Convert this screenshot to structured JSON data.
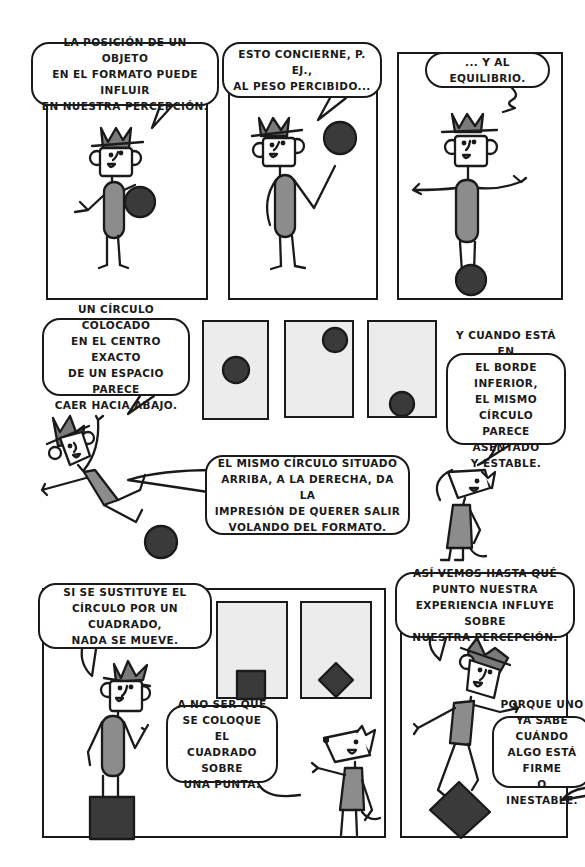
{
  "colors": {
    "ink": "#1a1a1a",
    "shirt_gray": "#8c8c8c",
    "hat_gray": "#7a7a7a",
    "ball_dark": "#3a3a3a",
    "frame_fill": "#ececec",
    "background": "#ffffff"
  },
  "row1": {
    "panel1": {
      "bubble": "La Posición de un objeto\nen el formato puede influir\nen nuestra Percepción."
    },
    "panel2": {
      "bubble": "Esto concierne, P. ej.,\nal Peso Percibido..."
    },
    "panel3": {
      "bubble": "... Y al equilibrio."
    }
  },
  "row2": {
    "bubble_left": "Un círculo colocado\nen el centro exacto\nde un espacio Parece\ncaer hacia abajo.",
    "bubble_right": "Y cuando está en\nel borde inferior,\nel mismo círculo\nParece asentado\ny estable.",
    "bubble_middle": "El mismo círculo situado\narriba, a la derecha, da la\nimpresión de querer salir\nvolando del formato.",
    "frames": [
      {
        "shape": "circle",
        "position": "center"
      },
      {
        "shape": "circle",
        "position": "top-right"
      },
      {
        "shape": "circle",
        "position": "bottom"
      }
    ]
  },
  "row3": {
    "panel_left": {
      "bubble_top": "Si se sustituye el\ncírculo Por un cuadrado,\nnada se mueve.",
      "bubble_bottom": "A no ser que\nse coloque el\ncuadrado sobre\nuna Punta.",
      "frames": [
        {
          "shape": "square",
          "position": "bottom"
        },
        {
          "shape": "diamond",
          "position": "bottom"
        }
      ]
    },
    "panel_right": {
      "bubble_top": "Así vemos hasta qué\nPunto nuestra\nexperiencia influye sobre\nnuestra Percepción.",
      "bubble_bottom": "Porque uno\nya sabe cuándo\nalgo está firme\no inestable."
    }
  }
}
